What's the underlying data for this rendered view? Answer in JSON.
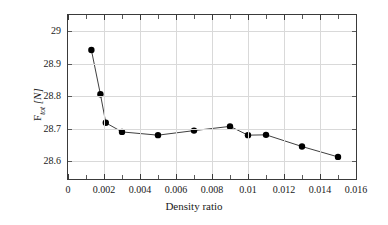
{
  "chart_data": {
    "type": "line",
    "title": "",
    "xlabel": "Density ratio",
    "ylabel": "F_tot [N]",
    "ylabel_base": "F",
    "ylabel_sub": "tot",
    "ylabel_unit": "[N]",
    "xlim": [
      0,
      0.016
    ],
    "ylim": [
      28.545,
      29.05
    ],
    "grid": true,
    "legend": null,
    "xticks": [
      0,
      0.002,
      0.004,
      0.006,
      0.008,
      0.01,
      0.012,
      0.014,
      0.016
    ],
    "xtick_labels": [
      "0",
      "0.002",
      "0.004",
      "0.006",
      "0.008",
      "0.01",
      "0.012",
      "0.014",
      "0.016"
    ],
    "yticks": [
      28.6,
      28.7,
      28.8,
      28.9,
      29.0
    ],
    "ytick_labels": [
      "28.6",
      "28.7",
      "28.8",
      "28.9",
      "29"
    ],
    "series": [
      {
        "name": "F_tot",
        "marker": "circle",
        "marker_color": "#000000",
        "line_color": "#404040",
        "x": [
          0.0013,
          0.0018,
          0.0021,
          0.003,
          0.005,
          0.007,
          0.009,
          0.01,
          0.011,
          0.013,
          0.015
        ],
        "y": [
          28.942,
          28.806,
          28.718,
          28.69,
          28.68,
          28.694,
          28.707,
          28.68,
          28.681,
          28.645,
          28.613
        ]
      }
    ]
  }
}
